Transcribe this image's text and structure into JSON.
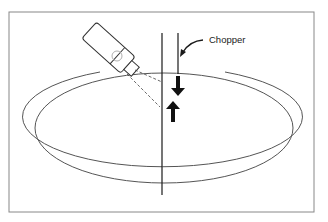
{
  "diagram": {
    "labels": {
      "chopper": "Chopper"
    },
    "elements": [
      "frame",
      "outer-ring-ellipse",
      "inner-ring-ellipse",
      "beam-line",
      "chopper-line",
      "probe-device",
      "probe-lens-circle",
      "dashed-beam-lines",
      "down-arrow",
      "up-arrow",
      "chopper-pointer-arrow"
    ],
    "colors": {
      "line": "#1a1a1a",
      "ring": "#555555",
      "probe_lens": "#b0b0b0",
      "background": "#ffffff"
    }
  }
}
